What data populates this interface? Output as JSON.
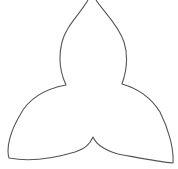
{
  "figure": {
    "stroke_color": "#555555",
    "background_color": "#ffffff"
  }
}
